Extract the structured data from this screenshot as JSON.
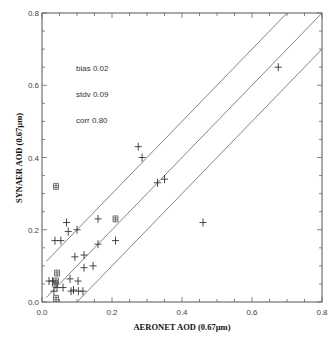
{
  "chart_data": {
    "type": "scatter",
    "title": "",
    "xlabel": "AERONET AOD (0.67µm)",
    "ylabel": "SYNAER AOD (0.67µm)",
    "xlim": [
      0.0,
      0.8
    ],
    "ylim": [
      0.0,
      0.8
    ],
    "x_ticks": [
      "0.0",
      "0.2",
      "0.4",
      "0.6",
      "0.8"
    ],
    "y_ticks": [
      "0.0",
      "0.2",
      "0.4",
      "0.6",
      "0.8"
    ],
    "grid": false,
    "legend": null,
    "annotations": {
      "bias": "bias 0.02",
      "stdv": "stdv 0.09",
      "corr": "corr 0.80"
    },
    "reference_lines": [
      {
        "name": "1:1",
        "slope": 1,
        "intercept": 0.0
      },
      {
        "name": "+0.1",
        "slope": 1,
        "intercept": 0.1
      },
      {
        "name": "-0.1",
        "slope": 1,
        "intercept": -0.1
      }
    ],
    "series": [
      {
        "name": "cross",
        "marker": "+",
        "points": [
          [
            0.675,
            0.65
          ],
          [
            0.275,
            0.43
          ],
          [
            0.286,
            0.4
          ],
          [
            0.33,
            0.33
          ],
          [
            0.35,
            0.34
          ],
          [
            0.07,
            0.22
          ],
          [
            0.075,
            0.195
          ],
          [
            0.1,
            0.2
          ],
          [
            0.037,
            0.17
          ],
          [
            0.054,
            0.17
          ],
          [
            0.16,
            0.23
          ],
          [
            0.21,
            0.17
          ],
          [
            0.16,
            0.16
          ],
          [
            0.46,
            0.22
          ],
          [
            0.094,
            0.125
          ],
          [
            0.12,
            0.13
          ],
          [
            0.12,
            0.095
          ],
          [
            0.146,
            0.1
          ],
          [
            0.08,
            0.064
          ],
          [
            0.103,
            0.058
          ],
          [
            0.06,
            0.04
          ],
          [
            0.083,
            0.03
          ],
          [
            0.09,
            0.033
          ],
          [
            0.104,
            0.03
          ],
          [
            0.117,
            0.03
          ],
          [
            0.02,
            0.058
          ],
          [
            0.03,
            0.058
          ],
          [
            0.043,
            0.04
          ],
          [
            0.034,
            0.03
          ]
        ]
      },
      {
        "name": "square",
        "marker": "boxed",
        "points": [
          [
            0.04,
            0.32
          ],
          [
            0.21,
            0.23
          ],
          [
            0.043,
            0.08
          ],
          [
            0.04,
            0.058
          ],
          [
            0.037,
            0.05
          ],
          [
            0.04,
            0.01
          ]
        ]
      }
    ]
  }
}
